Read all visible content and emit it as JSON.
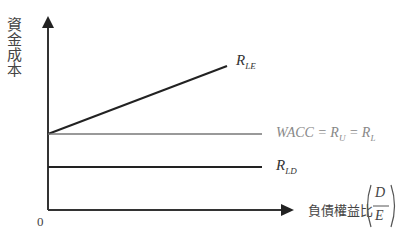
{
  "diagram": {
    "y_axis_label": "資金成本",
    "x_axis_label": "負債權益比",
    "x_axis_fraction": {
      "numerator": "D",
      "denominator": "E"
    },
    "origin_label": "0",
    "lines": [
      {
        "name": "R_LE",
        "label_main": "R",
        "label_sub": "LE",
        "description": "upward sloping cost of levered equity",
        "color": "#222222"
      },
      {
        "name": "WACC",
        "label_text": "WACC = R",
        "label_sub1": "U",
        "label_eq": " = R",
        "label_sub2": "L",
        "description": "flat WACC line",
        "color": "#888888"
      },
      {
        "name": "R_LD",
        "label_main": "R",
        "label_sub": "LD",
        "description": "flat cost of debt",
        "color": "#222222"
      }
    ]
  }
}
